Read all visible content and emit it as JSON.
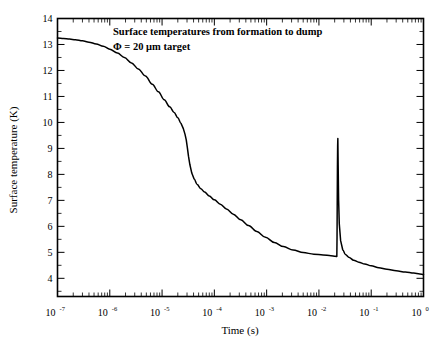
{
  "figure": {
    "annotation_line1": "Surface temperatures from formation to dump",
    "annotation_line2": "Φ = 20 μm target",
    "background_color": "#ffffff",
    "line_color": "#000000"
  },
  "chart_data": {
    "type": "line",
    "title": "Surface temperatures from formation to dump",
    "subtitle": "Φ = 20 μm target",
    "xlabel": "Time (s)",
    "ylabel": "Surface temperature (K)",
    "xscale": "log",
    "yscale": "linear",
    "xlim": [
      1e-07,
      1
    ],
    "ylim": [
      3.3,
      14
    ],
    "grid": false,
    "legend": null,
    "xtick_labels": [
      "10⁻⁷",
      "10⁻⁶",
      "10⁻⁵",
      "10⁻⁴",
      "10⁻³",
      "10⁻²",
      "10⁻¹",
      "10⁰"
    ],
    "xtick_values": [
      1e-07,
      1e-06,
      1e-05,
      0.0001,
      0.001,
      0.01,
      0.1,
      1
    ],
    "xtick_mantissas": [
      "10",
      "10",
      "10",
      "10",
      "10",
      "10",
      "10",
      "10"
    ],
    "xtick_exponents": [
      "-7",
      "-6",
      "-5",
      "-4",
      "-3",
      "-2",
      "-1",
      "0"
    ],
    "ytick_labels": [
      "4",
      "5",
      "6",
      "7",
      "8",
      "9",
      "10",
      "11",
      "12",
      "13",
      "14"
    ],
    "ytick_values": [
      4,
      5,
      6,
      7,
      8,
      9,
      10,
      11,
      12,
      13,
      14
    ],
    "yminor_step": 0.5,
    "series": [
      {
        "name": "surface temperature",
        "x": [
          1e-07,
          1.3e-07,
          1.7e-07,
          2.2e-07,
          3e-07,
          4e-07,
          5.5e-07,
          7.5e-07,
          1e-06,
          1.4e-06,
          1.9e-06,
          2.6e-06,
          3.5e-06,
          4.8e-06,
          6.5e-06,
          8.5e-06,
          1.1e-05,
          1.4e-05,
          1.7e-05,
          2e-05,
          2.3e-05,
          2.55e-05,
          2.75e-05,
          2.9e-05,
          3.05e-05,
          3.2e-05,
          3.4e-05,
          3.7e-05,
          4.1e-05,
          4.7e-05,
          5.5e-05,
          6.5e-05,
          8e-05,
          0.0001,
          0.00013,
          0.00017,
          0.00023,
          0.00032,
          0.00045,
          0.00065,
          0.00095,
          0.0014,
          0.0021,
          0.0032,
          0.005,
          0.008,
          0.012,
          0.017,
          0.0205,
          0.0215,
          0.022,
          0.0222,
          0.0224,
          0.0226,
          0.0228,
          0.023,
          0.0233,
          0.0238,
          0.0245,
          0.026,
          0.0285,
          0.032,
          0.038,
          0.046,
          0.058,
          0.075,
          0.1,
          0.14,
          0.2,
          0.3,
          0.45,
          0.65,
          0.85,
          1.0
        ],
        "y": [
          13.25,
          13.23,
          13.21,
          13.18,
          13.14,
          13.09,
          13.02,
          12.93,
          12.82,
          12.67,
          12.5,
          12.29,
          12.06,
          11.79,
          11.47,
          11.18,
          10.87,
          10.6,
          10.38,
          10.18,
          9.97,
          9.76,
          9.54,
          9.33,
          9.02,
          8.7,
          8.38,
          8.05,
          7.82,
          7.61,
          7.45,
          7.32,
          7.17,
          7.02,
          6.85,
          6.67,
          6.47,
          6.25,
          6.03,
          5.8,
          5.58,
          5.38,
          5.22,
          5.09,
          4.99,
          4.93,
          4.9,
          4.87,
          4.85,
          4.84,
          4.84,
          5.6,
          7.0,
          8.3,
          9.1,
          9.38,
          8.4,
          7.0,
          6.1,
          5.45,
          5.1,
          4.92,
          4.8,
          4.7,
          4.62,
          4.55,
          4.48,
          4.41,
          4.35,
          4.29,
          4.24,
          4.2,
          4.17,
          4.15
        ]
      }
    ],
    "annotations": [
      {
        "text": "Surface temperatures from formation to dump",
        "x": 3.5e-06,
        "y": 13.35
      },
      {
        "text": "Φ = 20 μm target",
        "x": 3.5e-06,
        "y": 12.65
      }
    ],
    "features": {
      "initial_temperature_K": 13.25,
      "knee_time_s": 3e-05,
      "knee_temperature_K": 8.5,
      "pre_spike_minimum_K": 4.84,
      "spike_time_s": 0.0223,
      "spike_peak_K": 9.4,
      "final_temperature_K": 4.15
    }
  }
}
